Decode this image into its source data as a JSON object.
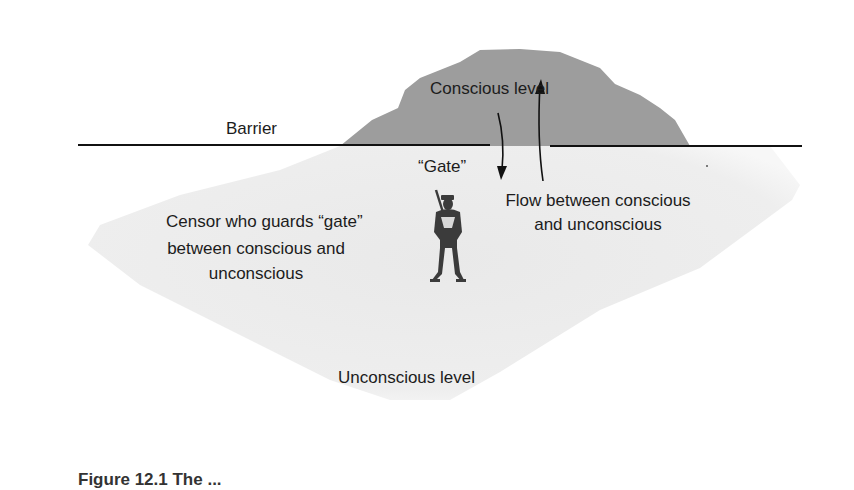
{
  "diagram": {
    "colors": {
      "conscious_fill": "#9d9d9d",
      "unconscious_fill": "#ebebeb",
      "barrier_line": "#111111",
      "text": "#1c1c1c"
    },
    "labels": {
      "conscious_level": "Conscious level",
      "barrier": "Barrier",
      "gate": "“Gate”",
      "censor_line1": "Censor who guards “gate”",
      "censor_line2": "between conscious and",
      "censor_line3": "unconscious",
      "flow_line1": "Flow between conscious",
      "flow_line2": "and unconscious",
      "unconscious_level": "Unconscious level"
    },
    "arrows": [
      {
        "name": "down-arrow",
        "direction": "down",
        "meaning": "conscious to unconscious"
      },
      {
        "name": "up-arrow",
        "direction": "up",
        "meaning": "unconscious to conscious"
      }
    ],
    "figure_icon": "soldier-censor-icon",
    "caption_partial": "Figure 12.1 The ..."
  }
}
